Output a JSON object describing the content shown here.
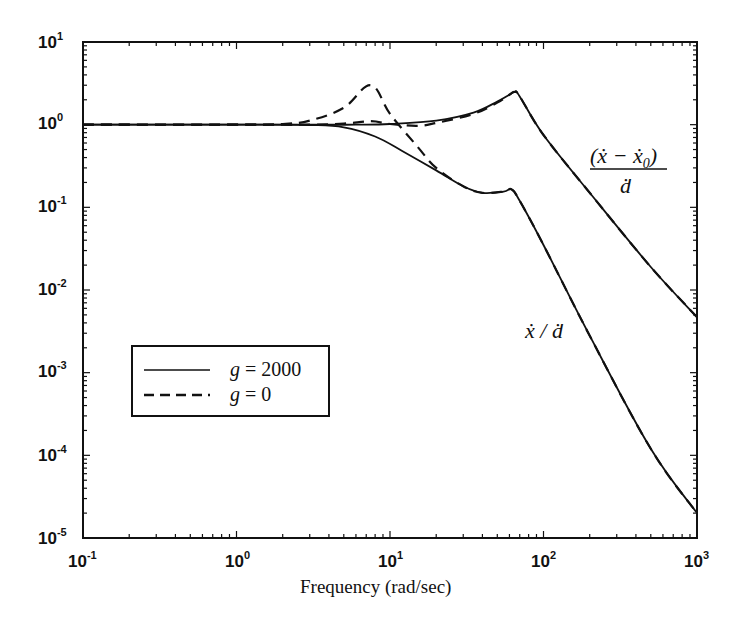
{
  "chart_data": {
    "type": "line",
    "title": "",
    "xlabel": "Frequency (rad/sec)",
    "ylabel": "",
    "xscale": "log",
    "yscale": "log",
    "xlim": [
      0.1,
      1000
    ],
    "ylim": [
      1e-05,
      10
    ],
    "grid": false,
    "x_ticks": [
      "10^-1",
      "10^0",
      "10^1",
      "10^2",
      "10^3"
    ],
    "y_ticks": [
      "10^1",
      "10^0",
      "10^-1",
      "10^-2",
      "10^-3",
      "10^-4",
      "10^-5"
    ],
    "legend": {
      "position": "center-left",
      "entries": [
        {
          "label": "g = 2000",
          "style": "solid"
        },
        {
          "label": "g = 0",
          "style": "dashed"
        }
      ]
    },
    "annotations": [
      {
        "text": "(ẋ − ẋ0) / ḋ",
        "near": "upper curve, x≈300 rad/s"
      },
      {
        "text": "ẋ / ḋ",
        "near": "lower curve, x≈150 rad/s"
      }
    ],
    "series": [
      {
        "name": "(x_dot - x0_dot)/d_dot, g = 2000",
        "style": "solid",
        "x": [
          0.1,
          1,
          3,
          6,
          10,
          20,
          35,
          50,
          60,
          65,
          70,
          100,
          200,
          500,
          1000
        ],
        "y": [
          1.0,
          1.0,
          1.0,
          1.0,
          1.02,
          1.12,
          1.4,
          1.9,
          2.3,
          2.5,
          2.2,
          0.75,
          0.15,
          0.019,
          0.0047
        ]
      },
      {
        "name": "x_dot/d_dot, g = 2000",
        "style": "solid",
        "x": [
          0.1,
          1,
          3,
          5,
          8,
          12,
          20,
          30,
          40,
          55,
          62,
          70,
          100,
          200,
          500,
          1000
        ],
        "y": [
          1.0,
          1.0,
          0.99,
          0.93,
          0.72,
          0.48,
          0.28,
          0.18,
          0.15,
          0.155,
          0.165,
          0.12,
          0.035,
          0.0028,
          0.00012,
          2e-05
        ]
      },
      {
        "name": "x_dot/d_dot, g = 0 (resonant branch)",
        "style": "dashed",
        "x": [
          0.1,
          1,
          2,
          3,
          5,
          7.5,
          10,
          15,
          20,
          30,
          40,
          55,
          62,
          70,
          100,
          200,
          500,
          1000
        ],
        "y": [
          1.0,
          1.0,
          1.02,
          1.12,
          1.6,
          3.0,
          1.35,
          0.55,
          0.3,
          0.18,
          0.15,
          0.155,
          0.165,
          0.12,
          0.035,
          0.0028,
          0.00012,
          2e-05
        ]
      },
      {
        "name": "(x_dot - x0_dot)/d_dot, g = 0",
        "style": "dashed",
        "x": [
          0.1,
          1,
          3,
          5,
          7.5,
          10,
          15,
          20,
          35,
          50,
          60,
          65,
          70,
          100,
          200,
          500,
          1000
        ],
        "y": [
          1.0,
          1.0,
          1.0,
          1.03,
          1.1,
          1.02,
          0.97,
          1.05,
          1.35,
          1.85,
          2.3,
          2.5,
          2.2,
          0.75,
          0.15,
          0.019,
          0.0047
        ]
      }
    ]
  },
  "labels": {
    "xlabel": "Frequency (rad/sec)",
    "x_ticks": [
      {
        "base": "10",
        "exp": "-1"
      },
      {
        "base": "10",
        "exp": "0"
      },
      {
        "base": "10",
        "exp": "1"
      },
      {
        "base": "10",
        "exp": "2"
      },
      {
        "base": "10",
        "exp": "3"
      }
    ],
    "y_ticks": [
      {
        "base": "10",
        "exp": "1"
      },
      {
        "base": "10",
        "exp": "0"
      },
      {
        "base": "10",
        "exp": "-1"
      },
      {
        "base": "10",
        "exp": "-2"
      },
      {
        "base": "10",
        "exp": "-3"
      },
      {
        "base": "10",
        "exp": "-4"
      },
      {
        "base": "10",
        "exp": "-5"
      }
    ],
    "legend": {
      "solid": {
        "var": "g",
        "eq": " = 2000"
      },
      "dashed": {
        "var": "g",
        "eq": " =  0"
      }
    },
    "annot_upper": {
      "num": "(ẋ − ẋ",
      "sub": "0",
      "close": ")",
      "den": "ḋ"
    },
    "annot_lower": {
      "text": "ẋ / ḋ"
    }
  },
  "colors": {
    "line": "#111111",
    "background": "#ffffff"
  }
}
